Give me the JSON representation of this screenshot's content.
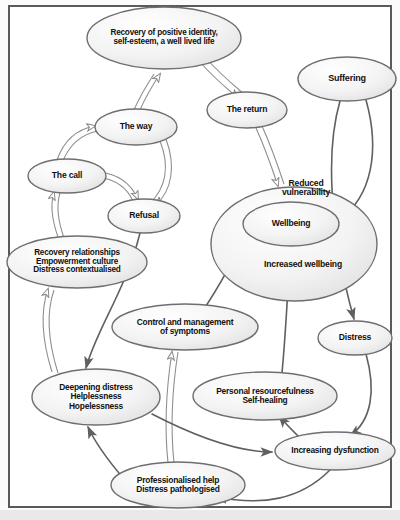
{
  "diagram": {
    "frame": {
      "border_color": "#5a5a5a",
      "background": "#ffffff"
    },
    "styles": {
      "node_fill_light": "#f4f4f4",
      "node_stroke": "#6e6e6e",
      "arrow_hollow_fill": "#ffffff",
      "arrow_hollow_stroke": "#8a8a8a",
      "arrow_solid": "#5f6063"
    },
    "nodes": [
      {
        "id": "recovery_identity",
        "label": "Recovery of positive identity,\nself-esteem, a well lived life",
        "cx": 164,
        "cy": 38,
        "rx": 77,
        "ry": 31,
        "font": 8.2
      },
      {
        "id": "suffering",
        "label": "Suffering",
        "cx": 347,
        "cy": 79,
        "rx": 49,
        "ry": 22,
        "font": 9
      },
      {
        "id": "the_return",
        "label": "The return",
        "cx": 247,
        "cy": 110,
        "rx": 40,
        "ry": 18,
        "font": 8.6
      },
      {
        "id": "the_way",
        "label": "The way",
        "cx": 136,
        "cy": 127,
        "rx": 41,
        "ry": 18,
        "font": 8.6
      },
      {
        "id": "the_call",
        "label": "The call",
        "cx": 67,
        "cy": 176,
        "rx": 39,
        "ry": 17,
        "font": 8.6
      },
      {
        "id": "reduced_vulnerability_outer",
        "label": "",
        "cx": 294,
        "cy": 244,
        "rx": 83,
        "ry": 57,
        "font": 8.6
      },
      {
        "id": "reduced_vulnerability_text",
        "label": "Reduced\nvulnerability",
        "cx": 306,
        "cy": 188,
        "rx": 0,
        "ry": 0,
        "font": 8.6
      },
      {
        "id": "wellbeing",
        "label": "Wellbeing",
        "cx": 291,
        "cy": 224,
        "rx": 48,
        "ry": 22,
        "font": 8.6
      },
      {
        "id": "increased_wellbeing_text",
        "label": "Increased wellbeing",
        "cx": 303,
        "cy": 265,
        "rx": 0,
        "ry": 0,
        "font": 8.6
      },
      {
        "id": "refusal",
        "label": "Refusal",
        "cx": 144,
        "cy": 216,
        "rx": 36,
        "ry": 17,
        "font": 8.6
      },
      {
        "id": "recovery_relationships",
        "label": "Recovery relationships\nEmpowerment culture\nDistress contextualised",
        "cx": 77,
        "cy": 262,
        "rx": 70,
        "ry": 26,
        "font": 8.2
      },
      {
        "id": "control_management",
        "label": "Control and management\nof symptoms",
        "cx": 185,
        "cy": 327,
        "rx": 73,
        "ry": 23,
        "font": 8.4
      },
      {
        "id": "distress",
        "label": "Distress",
        "cx": 355,
        "cy": 338,
        "rx": 37,
        "ry": 17,
        "font": 8.6
      },
      {
        "id": "personal_resourcefulness",
        "label": "Personal resourcefulness\nSelf-healing",
        "cx": 265,
        "cy": 396,
        "rx": 72,
        "ry": 24,
        "font": 8.4
      },
      {
        "id": "deepening_distress",
        "label": "Deepening distress\nHelplessness\nHopelessness",
        "cx": 96,
        "cy": 397,
        "rx": 64,
        "ry": 28,
        "font": 8.4
      },
      {
        "id": "increasing_dysfunction",
        "label": "Increasing dysfunction",
        "cx": 335,
        "cy": 451,
        "rx": 60,
        "ry": 19,
        "font": 8.4
      },
      {
        "id": "professionalised_help",
        "label": "Professionalised help\nDistress pathologised",
        "cx": 178,
        "cy": 485,
        "rx": 67,
        "ry": 23,
        "font": 8.4
      }
    ],
    "edges": [
      {
        "from": "the_way",
        "to": "recovery_identity",
        "style": "hollow"
      },
      {
        "from": "recovery_identity",
        "to": "the_return",
        "style": "hollow"
      },
      {
        "from": "the_call",
        "to": "the_way",
        "style": "hollow"
      },
      {
        "from": "the_way",
        "to": "refusal",
        "style": "hollow"
      },
      {
        "from": "the_call",
        "to": "refusal",
        "style": "hollow"
      },
      {
        "from": "recovery_relationships",
        "to": "the_call",
        "style": "hollow"
      },
      {
        "from": "deepening_distress",
        "to": "recovery_relationships",
        "style": "hollow"
      },
      {
        "from": "the_return",
        "to": "reduced_vulnerability_outer",
        "style": "hollow"
      },
      {
        "from": "refusal",
        "to": "deepening_distress",
        "style": "solid"
      },
      {
        "from": "suffering",
        "to": "wellbeing",
        "style": "solid"
      },
      {
        "from": "suffering",
        "to": "distress",
        "style": "solid"
      },
      {
        "from": "control_management",
        "to": "wellbeing",
        "style": "solid"
      },
      {
        "from": "personal_resourcefulness",
        "to": "wellbeing",
        "style": "solid"
      },
      {
        "from": "professionalised_help",
        "to": "control_management",
        "style": "hollow"
      },
      {
        "from": "increasing_dysfunction",
        "to": "personal_resourcefulness",
        "style": "solid"
      },
      {
        "from": "distress",
        "to": "increasing_dysfunction",
        "style": "solid"
      },
      {
        "from": "deepening_distress",
        "to": "increasing_dysfunction",
        "style": "solid"
      },
      {
        "from": "professionalised_help",
        "to": "deepening_distress",
        "style": "solid"
      },
      {
        "from": "increasing_dysfunction",
        "to": "professionalised_help",
        "style": "solid"
      }
    ]
  }
}
